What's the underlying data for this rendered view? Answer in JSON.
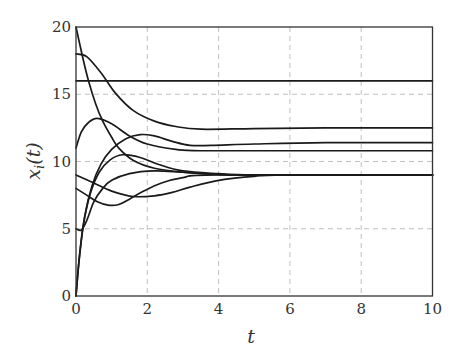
{
  "chart_data": {
    "type": "line",
    "title": "",
    "xlabel": "t",
    "ylabel": "x_i(t)",
    "xlim": [
      0,
      10
    ],
    "ylim": [
      0,
      20
    ],
    "xticks": [
      0,
      2,
      4,
      6,
      8,
      10
    ],
    "yticks": [
      0,
      5,
      10,
      15,
      20
    ],
    "xtick_labels": [
      "0",
      "2",
      "4",
      "6",
      "8",
      "10"
    ],
    "ytick_labels": [
      "0",
      "5",
      "10",
      "15",
      "20"
    ],
    "grid": true,
    "legend": null,
    "series": [
      {
        "name": "x1",
        "points": [
          [
            0,
            16
          ],
          [
            10,
            16
          ]
        ]
      },
      {
        "name": "x2",
        "points": [
          [
            0,
            18
          ],
          [
            0.3,
            17.8
          ],
          [
            0.7,
            16.6
          ],
          [
            1.1,
            15.1
          ],
          [
            1.6,
            13.8
          ],
          [
            2.2,
            13
          ],
          [
            2.8,
            12.6
          ],
          [
            3.5,
            12.4
          ],
          [
            5,
            12.45
          ],
          [
            7,
            12.5
          ],
          [
            10,
            12.5
          ]
        ]
      },
      {
        "name": "x3",
        "points": [
          [
            0,
            20
          ],
          [
            0.2,
            17.6
          ],
          [
            0.35,
            16
          ],
          [
            0.55,
            14.3
          ],
          [
            0.75,
            13
          ],
          [
            1,
            11.8
          ],
          [
            1.2,
            11
          ],
          [
            1.6,
            10.1
          ],
          [
            2.2,
            9.5
          ],
          [
            3,
            9.2
          ],
          [
            4,
            9.05
          ],
          [
            6,
            9
          ],
          [
            10,
            9
          ]
        ]
      },
      {
        "name": "x4",
        "points": [
          [
            0,
            11
          ],
          [
            0.15,
            12.2
          ],
          [
            0.35,
            12.9
          ],
          [
            0.6,
            13.2
          ],
          [
            1,
            12.8
          ],
          [
            1.5,
            11.9
          ],
          [
            2,
            11.3
          ],
          [
            2.8,
            10.9
          ],
          [
            3.5,
            10.8
          ],
          [
            6,
            10.8
          ],
          [
            10,
            10.8
          ]
        ]
      },
      {
        "name": "x5",
        "points": [
          [
            0,
            0
          ],
          [
            0.1,
            3
          ],
          [
            0.25,
            6
          ],
          [
            0.45,
            8.2
          ],
          [
            0.7,
            9.8
          ],
          [
            1,
            10.9
          ],
          [
            1.4,
            11.7
          ],
          [
            1.8,
            12
          ],
          [
            2.2,
            11.9
          ],
          [
            2.7,
            11.5
          ],
          [
            3.2,
            11.2
          ],
          [
            3.8,
            11.2
          ],
          [
            5,
            11.3
          ],
          [
            7,
            11.4
          ],
          [
            10,
            11.4
          ]
        ]
      },
      {
        "name": "x6",
        "points": [
          [
            0,
            0
          ],
          [
            0.08,
            2.5
          ],
          [
            0.2,
            5.2
          ],
          [
            0.4,
            7.6
          ],
          [
            0.65,
            9.2
          ],
          [
            0.95,
            10.1
          ],
          [
            1.3,
            10.5
          ],
          [
            1.8,
            10.3
          ],
          [
            2.3,
            9.8
          ],
          [
            3,
            9.3
          ],
          [
            4,
            9.1
          ],
          [
            5,
            9
          ],
          [
            10,
            9
          ]
        ]
      },
      {
        "name": "x7",
        "points": [
          [
            0,
            5
          ],
          [
            0.15,
            4.9
          ],
          [
            0.3,
            5.6
          ],
          [
            0.5,
            7
          ],
          [
            0.75,
            8
          ],
          [
            1,
            8.6
          ],
          [
            1.5,
            9.1
          ],
          [
            2.2,
            9.3
          ],
          [
            3,
            9.2
          ],
          [
            4,
            9.05
          ],
          [
            5,
            9
          ],
          [
            10,
            9
          ]
        ]
      },
      {
        "name": "x8",
        "points": [
          [
            0,
            9
          ],
          [
            0.5,
            8.4
          ],
          [
            1,
            7.8
          ],
          [
            1.6,
            7.4
          ],
          [
            2.2,
            7.45
          ],
          [
            2.7,
            7.7
          ],
          [
            3.2,
            8.1
          ],
          [
            4,
            8.6
          ],
          [
            5,
            8.9
          ],
          [
            6,
            9
          ],
          [
            10,
            9
          ]
        ]
      },
      {
        "name": "x9",
        "points": [
          [
            0,
            8
          ],
          [
            0.3,
            7.5
          ],
          [
            0.6,
            7
          ],
          [
            0.9,
            6.75
          ],
          [
            1.2,
            6.8
          ],
          [
            1.5,
            7.2
          ],
          [
            1.9,
            7.8
          ],
          [
            2.4,
            8.4
          ],
          [
            3,
            8.8
          ],
          [
            4,
            9
          ],
          [
            10,
            9
          ]
        ]
      }
    ]
  },
  "axes": {
    "xlabel": "t",
    "ylabel_base": "x",
    "ylabel_sub": "i",
    "ylabel_arg": "(t)"
  },
  "colors": {
    "curve": "#1a1a1a",
    "grid": "#b8b8b8",
    "frame": "#333333"
  }
}
